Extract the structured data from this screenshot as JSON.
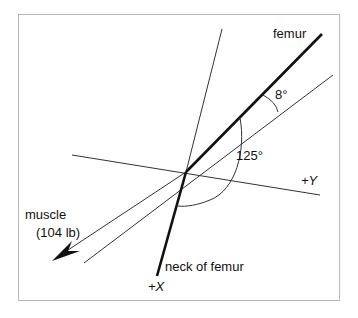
{
  "diagram": {
    "labels": {
      "femur": "femur",
      "angle_small": "8°",
      "angle_large": "125°",
      "axis_y": "+Y",
      "axis_x": "+X",
      "muscle": "muscle",
      "muscle_force": "(104 lb)",
      "neck": "neck of femur"
    },
    "colors": {
      "line": "#111111",
      "thin_line": "#333333",
      "frame": "#b9b9b9"
    }
  }
}
